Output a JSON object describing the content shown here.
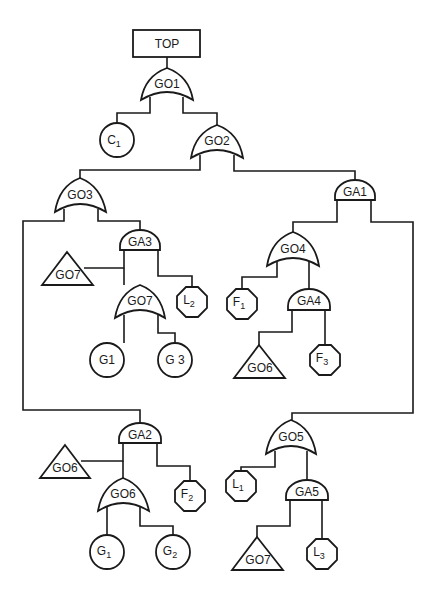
{
  "diagram": {
    "type": "fault-tree",
    "top_event": "TOP",
    "gates": {
      "g01": {
        "label": "GO1",
        "type": "OR"
      },
      "g02": {
        "label": "GO2",
        "type": "OR"
      },
      "g03": {
        "label": "GO3",
        "type": "OR"
      },
      "ga1": {
        "label": "GA1",
        "type": "AND"
      },
      "ga3": {
        "label": "GA3",
        "type": "AND"
      },
      "g07a": {
        "label": "GO7",
        "type": "OR"
      },
      "g04": {
        "label": "GO4",
        "type": "OR"
      },
      "ga4": {
        "label": "GA4",
        "type": "AND"
      },
      "ga2": {
        "label": "GA2",
        "type": "AND"
      },
      "g06a": {
        "label": "GO6",
        "type": "OR"
      },
      "g05": {
        "label": "GO5",
        "type": "OR"
      },
      "ga5": {
        "label": "GA5",
        "type": "AND"
      }
    },
    "transfers": {
      "t_g07_1": {
        "label": "GO7"
      },
      "t_g06_1": {
        "label": "GO6"
      },
      "t_g06_2": {
        "label": "GO6"
      },
      "t_g07_2": {
        "label": "GO7"
      }
    },
    "basic_events": {
      "c1": {
        "main": "C",
        "sub": "1"
      },
      "g1a": {
        "main": "G",
        "sub": "1"
      },
      "g3": {
        "main": "G",
        "sub": "3"
      },
      "g1b": {
        "main": "G",
        "sub": "1"
      },
      "g2": {
        "main": "G",
        "sub": "2"
      }
    },
    "undeveloped_events": {
      "l2": {
        "main": "L",
        "sub": "2"
      },
      "f1": {
        "main": "F",
        "sub": "1"
      },
      "f3": {
        "main": "F",
        "sub": "3"
      },
      "f2": {
        "main": "F",
        "sub": "2"
      },
      "l1": {
        "main": "L",
        "sub": "1"
      },
      "l3": {
        "main": "L",
        "sub": "3"
      }
    },
    "edges": [
      [
        "TOP",
        "GO1"
      ],
      [
        "GO1",
        "C1"
      ],
      [
        "GO1",
        "GO2"
      ],
      [
        "GO2",
        "GO3"
      ],
      [
        "GO2",
        "GA1"
      ],
      [
        "GO3",
        "GA2"
      ],
      [
        "GO3",
        "GA3"
      ],
      [
        "GA3",
        "GO7(transfer)"
      ],
      [
        "GA3",
        "GO7"
      ],
      [
        "GA3",
        "L2"
      ],
      [
        "GO7",
        "G1"
      ],
      [
        "GO7",
        "G3"
      ],
      [
        "GA1",
        "GO4"
      ],
      [
        "GA1",
        "GO5"
      ],
      [
        "GO4",
        "F1"
      ],
      [
        "GO4",
        "GA4"
      ],
      [
        "GA4",
        "GO6(transfer)"
      ],
      [
        "GA4",
        "F3"
      ],
      [
        "GA2",
        "GO6(transfer)"
      ],
      [
        "GA2",
        "GO6"
      ],
      [
        "GA2",
        "F2"
      ],
      [
        "GO6",
        "G1"
      ],
      [
        "GO6",
        "G2"
      ],
      [
        "GO5",
        "L1"
      ],
      [
        "GO5",
        "GA5"
      ],
      [
        "GA5",
        "GO7(transfer)"
      ],
      [
        "GA5",
        "L3"
      ]
    ]
  }
}
